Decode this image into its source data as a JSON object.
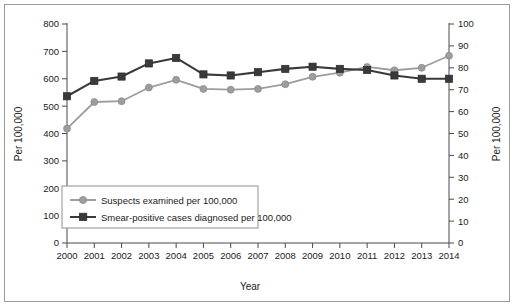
{
  "chart_data": {
    "type": "line",
    "title": "",
    "xlabel": "Year",
    "ylabel": "Per 100,000",
    "y2label": "Per 100,000",
    "categories": [
      "2000",
      "2001",
      "2002",
      "2003",
      "2004",
      "2005",
      "2006",
      "2007",
      "2008",
      "2009",
      "2010",
      "2011",
      "2012",
      "2013",
      "2014"
    ],
    "x": [
      2000,
      2001,
      2002,
      2003,
      2004,
      2005,
      2006,
      2007,
      2008,
      2009,
      2010,
      2011,
      2012,
      2013,
      2014
    ],
    "ylim": [
      0,
      800
    ],
    "y2lim": [
      0,
      100
    ],
    "yticks": [
      0,
      100,
      200,
      300,
      400,
      500,
      600,
      700,
      800
    ],
    "y2ticks": [
      0,
      10,
      20,
      30,
      40,
      50,
      60,
      70,
      80,
      90,
      100
    ],
    "grid": false,
    "legend_position": "lower-left-inside",
    "series": [
      {
        "name": "Suspects examined per 100,000",
        "axis": "left",
        "marker": "circle",
        "color": "#9d9d9d",
        "values": [
          418,
          515,
          518,
          568,
          596,
          563,
          560,
          563,
          580,
          607,
          622,
          643,
          631,
          640,
          684
        ]
      },
      {
        "name": "Smear-positive cases diagnosed per 100,000",
        "axis": "right",
        "marker": "square",
        "color": "#3a3a3a",
        "values": [
          67,
          74,
          76,
          82,
          84.5,
          77,
          76.5,
          78,
          79.5,
          80.5,
          79.5,
          79,
          76.5,
          75,
          75
        ]
      }
    ]
  },
  "axis_labels": {
    "left_title": "Per 100,000",
    "right_title": "Per 100,000",
    "x_title": "Year"
  },
  "legend": {
    "items": [
      {
        "label": "Suspects examined per 100,000",
        "marker": "circle-marker",
        "color": "#9d9d9d"
      },
      {
        "label": "Smear-positive cases diagnosed per 100,000",
        "marker": "square-marker",
        "color": "#3a3a3a"
      }
    ]
  },
  "colors": {
    "series_suspects": "#9d9d9d",
    "series_smear": "#3a3a3a",
    "axis": "#4a4a4a",
    "frame": "#9a9a9a",
    "text": "#1b1b1b",
    "background": "#ffffff"
  }
}
